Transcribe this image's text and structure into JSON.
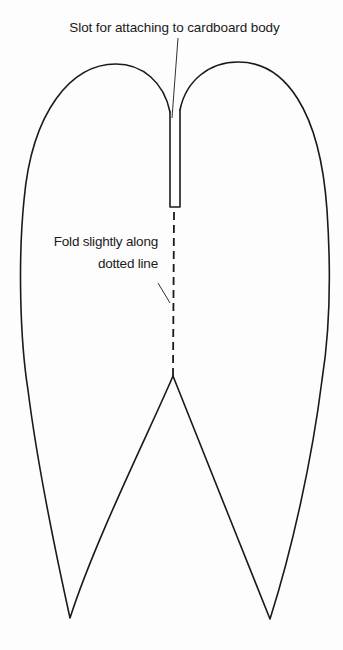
{
  "diagram": {
    "labels": {
      "slot": "Slot for attaching to cardboard body",
      "fold_line1": "Fold slightly along",
      "fold_line2": "dotted line"
    },
    "colors": {
      "stroke": "#1a1a1a",
      "background": "#fdfdfd"
    },
    "parts": [
      {
        "name": "left-wing-lobe"
      },
      {
        "name": "right-wing-lobe"
      },
      {
        "name": "attachment-slot"
      },
      {
        "name": "fold-line",
        "style": "dashed"
      }
    ]
  }
}
